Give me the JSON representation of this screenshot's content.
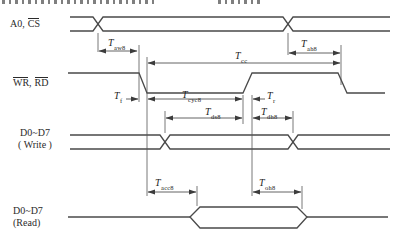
{
  "signals": {
    "address": {
      "prefix": "A0,",
      "cs": "CS"
    },
    "control": {
      "wr": "WR",
      "comma": ",",
      "rd": "RD"
    },
    "data_write": {
      "bus": "D0~D7",
      "mode": "( Write )"
    },
    "data_read": {
      "bus": "D0~D7",
      "mode": "(Read)"
    }
  },
  "timing": {
    "aw8": {
      "base": "T",
      "sub": "aw8"
    },
    "ah8": {
      "base": "T",
      "sub": "ah8"
    },
    "cc": {
      "base": "T",
      "sub": "cc"
    },
    "f": {
      "base": "T",
      "sub": "f"
    },
    "cyc8": {
      "base": "T",
      "sub": "cyc8"
    },
    "r": {
      "base": "T",
      "sub": "r"
    },
    "ds8": {
      "base": "T",
      "sub": "ds8"
    },
    "dh8": {
      "base": "T",
      "sub": "dh8"
    },
    "acc8": {
      "base": "T",
      "sub": "acc8"
    },
    "oh8": {
      "base": "T",
      "sub": "oh8"
    }
  },
  "colors": {
    "line": "#4a4a4a",
    "text": "#2b2b2b",
    "background": "#ffffff"
  }
}
